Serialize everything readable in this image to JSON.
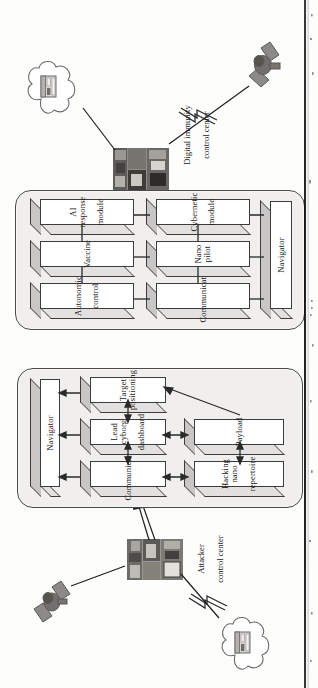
{
  "figure": {
    "orientation": "rotated-90-ccw",
    "type": "two-panel system architecture diagram",
    "background_color": "#fdfdfc",
    "box_fill": "#ffffff",
    "box_top_shade": "#c9c7c5",
    "box_side_shade": "#e3e1df",
    "container_fill": "#f0efee",
    "line_color": "#3c3c3c"
  },
  "panels": [
    {
      "id": "attacker",
      "caption": "Attacker\ncontrol center",
      "caption_line1": "Attacker",
      "caption_line2": "control center",
      "navigator_label": "Navigator",
      "boxes": [
        {
          "id": "hacking-nano-repertoire",
          "label": "Hacking nano\nrepertoire",
          "line1": "Hacking nano",
          "line2": "repertoire"
        },
        {
          "id": "payload",
          "label": "Payload",
          "line1": "Payload",
          "line2": ""
        },
        {
          "id": "communicator",
          "label": "Communicator",
          "line1": "Communicator",
          "line2": ""
        },
        {
          "id": "lead-cyborg-dashboard",
          "label": "Lead cyborg\ndashboard",
          "line1": "Lead cyborg",
          "line2": "dashboard"
        },
        {
          "id": "target-positioning",
          "label": "Target positioning",
          "line1": "Target positioning",
          "line2": ""
        }
      ],
      "external": [
        {
          "id": "cloud",
          "kind": "cloud-with-server-icon"
        },
        {
          "id": "satellite",
          "kind": "satellite"
        },
        {
          "id": "photo",
          "kind": "control-room-photograph"
        }
      ]
    },
    {
      "id": "immunity",
      "caption": "Digital immunity\ncontrol center",
      "caption_line1": "Digital immunity",
      "caption_line2": "control center",
      "navigator_label": "Navigator",
      "boxes": [
        {
          "id": "communicator",
          "label": "Communicator",
          "line1": "Communicator",
          "line2": ""
        },
        {
          "id": "nano-pilot",
          "label": "Nano pilot",
          "line1": "Nano pilot",
          "line2": ""
        },
        {
          "id": "cybernetic-module",
          "label": "Cybernetic\nmodule",
          "line1": "Cybernetic",
          "line2": "module"
        },
        {
          "id": "autonomic-control",
          "label": "Autonomic\ncontrol",
          "line1": "Autonomic",
          "line2": "control"
        },
        {
          "id": "vaccine",
          "label": "Vaccine",
          "line1": "Vaccine",
          "line2": ""
        },
        {
          "id": "ai-response-module",
          "label": "AI response\nmodule",
          "line1": "AI response",
          "line2": "module"
        }
      ],
      "external": [
        {
          "id": "cloud",
          "kind": "cloud-with-server-icon"
        },
        {
          "id": "satellite",
          "kind": "satellite"
        },
        {
          "id": "photo",
          "kind": "control-room-photograph"
        }
      ]
    }
  ]
}
